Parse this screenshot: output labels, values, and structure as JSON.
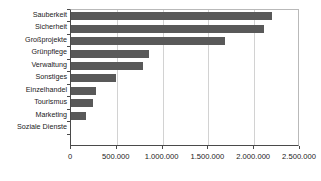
{
  "chart_data": {
    "type": "bar",
    "orientation": "horizontal",
    "title": "",
    "subtitle": "",
    "xlabel": "",
    "ylabel": "",
    "xlim": [
      0,
      2500000
    ],
    "grid": true,
    "legend": false,
    "legend_position": "none",
    "bar_color": "#595959",
    "categories": [
      "Sauberkeit",
      "Sicherheit",
      "Großprojekte",
      "Grünpflege",
      "Verwaltung",
      "Sonstiges",
      "Einzelhandel",
      "Tourismus",
      "Marketing",
      "Soziale Dienste"
    ],
    "values": [
      2190000,
      2110000,
      1680000,
      850000,
      790000,
      490000,
      270000,
      240000,
      160000,
      0
    ],
    "xticks": [
      0,
      500000,
      1000000,
      1500000,
      2000000,
      2500000
    ],
    "xtick_labels": [
      "0",
      "500.000",
      "1.000.000",
      "1.500.000",
      "2.000.000",
      "2.500.000"
    ]
  },
  "colors": {
    "bar": "#595959",
    "axis": "#4a4a4a",
    "grid": "#d2d2d2",
    "frame": "#b9b9b9",
    "background": "#ffffff",
    "text": "#1a1a1a"
  }
}
